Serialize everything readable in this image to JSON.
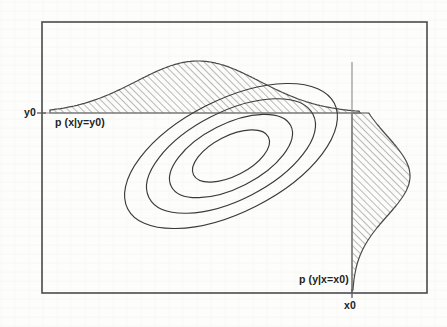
{
  "figure": {
    "labels": {
      "y_axis_value": "y0",
      "x_axis_value": "x0",
      "conditional_x_given_y": "p (x|y=y0)",
      "conditional_y_given_x": "p (y|x=x0)"
    },
    "colors": {
      "background": "#fdfdfc",
      "frame": "#4a4a4a",
      "contour": "#3a3a3a",
      "conditional_axis": "#8d8d8d",
      "hatch": "#5c5c5c",
      "text": "#232323"
    }
  },
  "chart_data": {
    "type": "line",
    "xlabel": "",
    "ylabel": "",
    "grid": false,
    "legend": null,
    "plot_frame": {
      "x": 42,
      "y": 22,
      "width": 385,
      "height": 271
    },
    "xlim": [
      42,
      427
    ],
    "ylim": [
      293,
      22
    ],
    "conditioning_lines": {
      "y0_line": {
        "orientation": "horizontal",
        "y": 113,
        "x_start": 42,
        "x_end": 360
      },
      "x0_line": {
        "orientation": "vertical",
        "x": 352,
        "y_start": 62,
        "y_end": 293
      }
    },
    "contours": {
      "description": "four nested ellipses of constant joint density",
      "center": [
        231,
        156
      ],
      "rotation_deg": -27,
      "levels": [
        {
          "level": 1,
          "semi_major": 116,
          "semi_minor": 56
        },
        {
          "level": 2,
          "semi_major": 92,
          "semi_minor": 44
        },
        {
          "level": 3,
          "semi_major": 67,
          "semi_minor": 32
        },
        {
          "level": 4,
          "semi_major": 42,
          "semi_minor": 20
        }
      ]
    },
    "marginals": [
      {
        "name": "p (x|y=y0)",
        "orientation": "horizontal",
        "baseline_y": 113,
        "mean_x": 198,
        "peak_height": 52,
        "std_dev": 62,
        "hatched": true,
        "hatch_angle_deg": 45,
        "x_range": [
          50,
          360
        ]
      },
      {
        "name": "p (y|x=x0)",
        "orientation": "vertical",
        "baseline_x": 352,
        "mean_y": 176,
        "peak_width": 58,
        "std_dev": 40,
        "hatched": true,
        "hatch_angle_deg": 45,
        "y_range": [
          113,
          291
        ]
      }
    ],
    "annotations": [
      {
        "text": "y0",
        "x": 30,
        "y": 113,
        "anchor": "right-of-y-axis-tick"
      },
      {
        "text": "x0",
        "x": 352,
        "y": 305,
        "anchor": "below-x-axis-tick"
      },
      {
        "text": "p (x|y=y0)",
        "x": 55,
        "y": 122,
        "anchor": "left"
      },
      {
        "text": "p (y|x=x0)",
        "x": 299,
        "y": 279,
        "anchor": "left"
      }
    ]
  }
}
